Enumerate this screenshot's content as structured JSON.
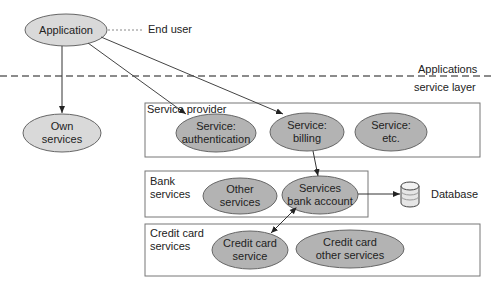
{
  "top": {
    "application": "Application",
    "end_user": "End user",
    "layer_label_above": "Applications",
    "layer_label_below": "service layer",
    "own_services_line1": "Own",
    "own_services_line2": "services"
  },
  "service_provider": {
    "title": "Service provider",
    "items": [
      {
        "line1": "Service:",
        "line2": "authentication"
      },
      {
        "line1": "Service:",
        "line2": "billing"
      },
      {
        "line1": "Service:",
        "line2": "etc."
      }
    ]
  },
  "bank_services": {
    "title_line1": "Bank",
    "title_line2": "services",
    "items": [
      {
        "line1": "Other",
        "line2": "services"
      },
      {
        "line1": "Services",
        "line2": "bank account"
      }
    ],
    "database": "Database"
  },
  "credit_card_services": {
    "title_line1": "Credit card",
    "title_line2": "services",
    "items": [
      {
        "line1": "Credit card",
        "line2": "service"
      },
      {
        "line1": "Credit card",
        "line2": "other services"
      }
    ]
  },
  "colors": {
    "ellipse_fill_light": "#d9d9d9",
    "ellipse_fill": "#b3b3b3",
    "stroke": "#555555"
  }
}
